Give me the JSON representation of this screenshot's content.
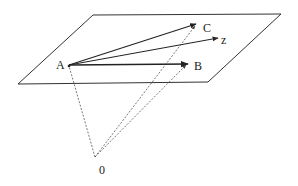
{
  "diagram": {
    "colors": {
      "line": "#333333",
      "dashed": "#555555",
      "background": "#ffffff"
    },
    "plane": {
      "corners": [
        [
          93,
          15
        ],
        [
          281,
          14
        ],
        [
          208,
          82
        ],
        [
          18,
          84
        ]
      ]
    },
    "points": {
      "A": {
        "label": "A",
        "x": 69,
        "y": 65,
        "label_x": 56,
        "label_y": 69
      },
      "B": {
        "label": "B",
        "x": 187,
        "y": 63,
        "label_x": 194,
        "label_y": 70
      },
      "C": {
        "label": "C",
        "x": 196,
        "y": 24,
        "label_x": 203,
        "label_y": 32
      },
      "z": {
        "label": "z",
        "x": 218,
        "y": 38,
        "label_x": 221,
        "label_y": 44
      },
      "O": {
        "label": "0",
        "x": 95,
        "y": 157,
        "label_x": 99,
        "label_y": 174
      }
    },
    "vectors": [
      {
        "from": "A",
        "to": "C",
        "style": "solid"
      },
      {
        "from": "A",
        "to": "z",
        "style": "solid"
      },
      {
        "from": "A",
        "to": "B",
        "style": "solid"
      },
      {
        "from": "O",
        "to": "A",
        "style": "dashed"
      },
      {
        "from": "O",
        "to": "C",
        "style": "dashed"
      },
      {
        "from": "O",
        "to": "B",
        "style": "dashed"
      }
    ]
  }
}
